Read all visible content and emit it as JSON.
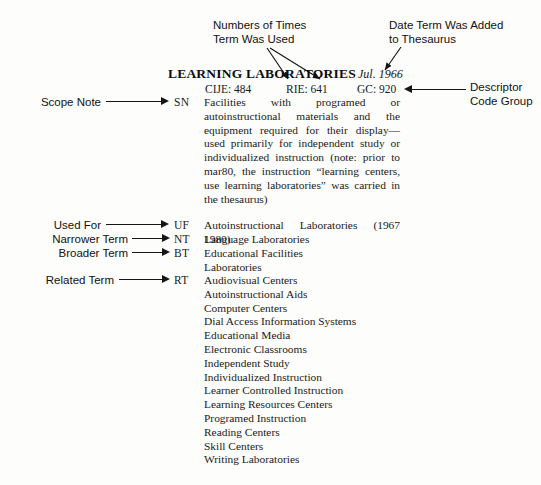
{
  "annotations": {
    "usage_counts": "Numbers of Times\nTerm Was Used",
    "date_added": "Date Term Was Added\nto Thesaurus",
    "descriptor_code_group": "Descriptor\nCode Group"
  },
  "side_labels": [
    {
      "label": "Scope Note",
      "code": "SN"
    },
    {
      "label": "Used For",
      "code": "UF"
    },
    {
      "label": "Narrower Term",
      "code": "NT"
    },
    {
      "label": "Broader Term",
      "code": "BT"
    },
    {
      "label": "Related Term",
      "code": "RT"
    }
  ],
  "entry": {
    "title": "LEARNING LABORATORIES",
    "date_added": "Jul. 1966",
    "stats": {
      "cije": "CIJE: 484",
      "rie": "RIE: 641",
      "gc": "GC: 920"
    },
    "scope_note": "Facilities with programed or autoinstructional materials and the equipment required for their display—used primarily for independent study or individualized instruction (note: prior to mar80, the instruction “learning centers, use learning laboratories” was carried in the thesaurus)",
    "used_for": "Autoinstructional Laboratories (1967 1980)",
    "narrower_terms": [
      "Language Laboratories"
    ],
    "broader_terms": [
      "Educational Facilities",
      "Laboratories"
    ],
    "related_terms": [
      "Audiovisual Centers",
      "Autoinstructional Aids",
      "Computer Centers",
      "Dial Access Information Systems",
      "Educational Media",
      "Electronic Classrooms",
      "Independent Study",
      "Individualized Instruction",
      "Learner Controlled Instruction",
      "Learning Resources Centers",
      "Programed Instruction",
      "Reading Centers",
      "Skill Centers",
      "Writing Laboratories"
    ]
  },
  "colors": {
    "page_background": "#fdfdfc",
    "ink": "#1a1a1a",
    "arrow": "#151515"
  }
}
